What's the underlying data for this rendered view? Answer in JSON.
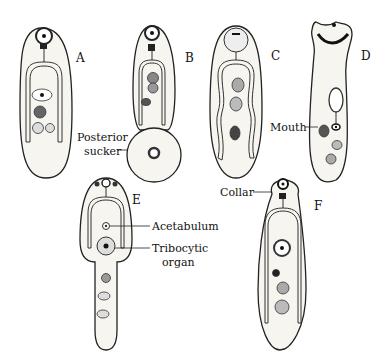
{
  "figure": {
    "panels": [
      {
        "id": "A",
        "letter": "A"
      },
      {
        "id": "B",
        "letter": "B"
      },
      {
        "id": "C",
        "letter": "C"
      },
      {
        "id": "D",
        "letter": "D"
      },
      {
        "id": "E",
        "letter": "E"
      },
      {
        "id": "F",
        "letter": "F"
      }
    ],
    "callouts": {
      "posterior_sucker_1": "Posterior",
      "posterior_sucker_2": "sucker",
      "mouth": "Mouth",
      "collar": "Collar",
      "acetabulum": "Acetabulum",
      "tribocytic_1": "Tribocytic",
      "tribocytic_2": "organ"
    },
    "colors": {
      "ink": "#222222",
      "body_fill": "#f7f5f0",
      "background": "#ffffff"
    }
  }
}
